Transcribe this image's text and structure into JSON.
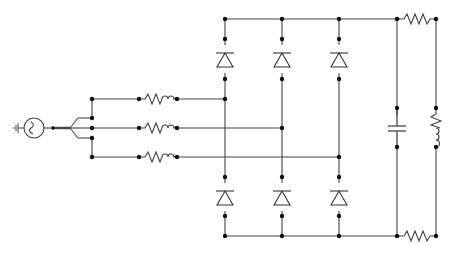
{
  "diagram": {
    "colors": {
      "wire": "#333333",
      "node": "#111111",
      "background": "#ffffff"
    },
    "components": [
      {
        "id": "source",
        "type": "ac-voltage-source",
        "label": "3-phase AC source"
      },
      {
        "id": "ground",
        "type": "ground"
      },
      {
        "id": "phase-a-impedance",
        "type": "resistor-inductor",
        "label": "Phase A line impedance"
      },
      {
        "id": "phase-b-impedance",
        "type": "resistor-inductor",
        "label": "Phase B line impedance"
      },
      {
        "id": "phase-c-impedance",
        "type": "resistor-inductor",
        "label": "Phase C line impedance"
      },
      {
        "id": "d1",
        "type": "diode",
        "label": "Upper diode A"
      },
      {
        "id": "d3",
        "type": "diode",
        "label": "Upper diode B"
      },
      {
        "id": "d5",
        "type": "diode",
        "label": "Upper diode C"
      },
      {
        "id": "d4",
        "type": "diode",
        "label": "Lower diode A"
      },
      {
        "id": "d6",
        "type": "diode",
        "label": "Lower diode B"
      },
      {
        "id": "d2",
        "type": "diode",
        "label": "Lower diode C"
      },
      {
        "id": "dc-capacitor",
        "type": "capacitor",
        "label": "DC link capacitor"
      },
      {
        "id": "top-resistor",
        "type": "resistor",
        "label": "Upper DC resistor"
      },
      {
        "id": "bottom-resistor",
        "type": "resistor",
        "label": "Lower DC resistor"
      },
      {
        "id": "load",
        "type": "resistor-inductor",
        "label": "RL load"
      }
    ]
  }
}
